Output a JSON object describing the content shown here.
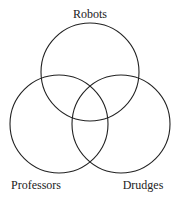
{
  "diagram": {
    "type": "venn",
    "sets": [
      {
        "name": "Robots",
        "label": "Robots",
        "cx": 90,
        "cy": 72,
        "r": 49
      },
      {
        "name": "Professors",
        "label": "Professors",
        "cx": 59,
        "cy": 124,
        "r": 49
      },
      {
        "name": "Drudges",
        "label": "Drudges",
        "cx": 121,
        "cy": 124,
        "r": 49
      }
    ]
  }
}
